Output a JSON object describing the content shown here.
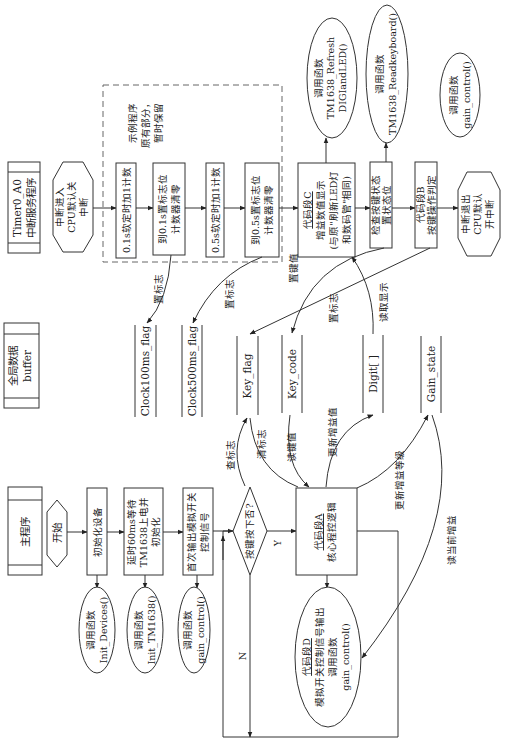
{
  "diagram": {
    "orientation": "rotated -90deg",
    "global_data": {
      "label_line1": "全局数据",
      "label_line2": "buffer"
    },
    "isr": {
      "header_line1": "Timer0_A0",
      "header_line2": "中断服务程序",
      "enter_line1": "中断进入",
      "enter_line2": "CPU默认关",
      "enter_line3": "中断",
      "note_line1": "示例程序",
      "note_line2": "原有部分，",
      "note_line3": "暂时保留",
      "step1": "0.1s软定时加1计数",
      "step2_line1": "到0.1s置标志位",
      "step2_line2": "计数器清零",
      "step3": "0.5s软定时加1计数",
      "step4_line1": "到0.5s置标志位",
      "step4_line2": "计数器清零",
      "codeC_line1": "代码段C",
      "codeC_line2": "增益数值显示",
      "codeC_line3": "(与原\"刷新LED灯",
      "codeC_line4": "和数码管\"相同)",
      "check_line1": "检查按键状态",
      "check_line2": "置状态位",
      "codeB_line1": "代码段B",
      "codeB_line2": "按键操作判定",
      "exit_line1": "中断退出",
      "exit_line2": "CPU默认",
      "exit_line3": "开中断",
      "cloud_refresh_line1": "调用函数",
      "cloud_refresh_line2": "TM1638_Refresh",
      "cloud_refresh_line3": "DIGIandLED()",
      "cloud_read_line1": "调用函数",
      "cloud_read_line2": "TM1638_Readkeyboard()",
      "cloud_gain_line1": "调用函数",
      "cloud_gain_line2": "gain_control()"
    },
    "stores": {
      "clock100": "Clock100ms_flag",
      "clock500": "Clock500ms_flag",
      "key_flag": "Key_flag",
      "key_code": "Key_code",
      "digit": "Digit[ ]",
      "gain_state": "Gain_state"
    },
    "edge_labels": {
      "set_flag1": "置标志",
      "set_flag2": "置标志",
      "set_key": "置键值",
      "set_flag3": "置标志",
      "read_display": "读取显示",
      "check_flag": "查标志",
      "clear_flag": "清标志",
      "read_key": "读键值",
      "update_gain_value": "更新增益值",
      "update_gain_level": "更新增益等级",
      "read_current_gain": "读当前增益",
      "yes": "Y",
      "no": "N"
    },
    "main": {
      "header": "主程序",
      "start": "开始",
      "init": "初始化设备",
      "delay_line1": "延时60ms等待",
      "delay_line2": "TM1638上电并",
      "delay_line3": "初始化",
      "first_line1": "首次输出模拟开关",
      "first_line2": "控制信号",
      "decision": "按键按下否?",
      "codeA_line1": "代码段A",
      "codeA_line2": "核心程控逻辑",
      "cloud_init_line1": "调用函数",
      "cloud_init_line2": "Init_Devices()",
      "cloud_tm_line1": "调用函数",
      "cloud_tm_line2": "Init_TM1638()",
      "cloud_gc_line1": "调用函数",
      "cloud_gc_line2": "gain_control()",
      "codeD_line1": "代码段D",
      "codeD_line2": "模拟开关控制信号输出",
      "codeD_line3": "调用函数",
      "codeD_line4": "gain_control()"
    }
  }
}
